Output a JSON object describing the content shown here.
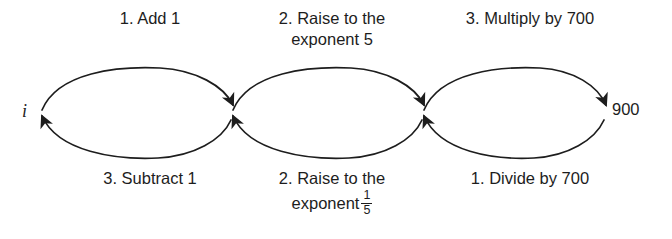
{
  "diagram": {
    "type": "chained-inverse-operations-flow",
    "background_color": "#ffffff",
    "stroke_color": "#1d1d1d",
    "endpoints": {
      "left": "i",
      "right": "900"
    },
    "forward_labels": [
      {
        "id": "forward-1",
        "line1": "1. Add 1",
        "line2": ""
      },
      {
        "id": "forward-2",
        "line1": "2. Raise to the",
        "line2": "exponent 5"
      },
      {
        "id": "forward-3",
        "line1": "3. Multiply by 700",
        "line2": ""
      }
    ],
    "reverse_labels": [
      {
        "id": "reverse-1",
        "line1": "3. Subtract 1",
        "line2": ""
      },
      {
        "id": "reverse-2",
        "line1": "2. Raise to the",
        "line2": "exponent",
        "fraction_numerator": "1",
        "fraction_denominator": "5"
      },
      {
        "id": "reverse-3",
        "line1": "1. Divide by 700",
        "line2": ""
      }
    ]
  }
}
